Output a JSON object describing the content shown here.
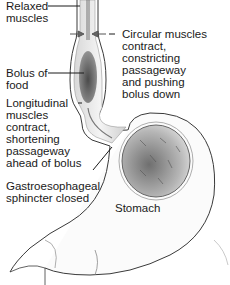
{
  "diagram": {
    "labels": {
      "relaxed_muscles": "Relaxed\nmuscles",
      "circular_muscles": "Circular muscles\ncontract,\nconstricting\npassageway\nand pushing\nbolus down",
      "bolus": "Bolus of\nfood",
      "longitudinal_muscles": "Longitudinal\nmuscles\ncontract,\nshortening\npassageway\nahead of bolus",
      "sphincter": "Gastroesophageal\nsphincter closed",
      "stomach": "Stomach"
    },
    "colors": {
      "line": "#3a3a3a",
      "wall": "#e6e6e6",
      "bolus": "#5a5a5a",
      "stomach_content": "#8a8a8a",
      "text": "#1a1a1a"
    }
  }
}
